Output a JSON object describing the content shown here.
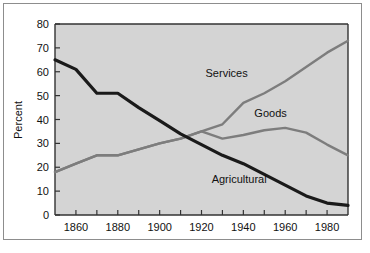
{
  "chart_data": {
    "type": "line",
    "title": "",
    "subtitle": "",
    "xlabel": "",
    "ylabel": "Percent",
    "xlim": [
      1850,
      1990
    ],
    "ylim": [
      0,
      80
    ],
    "grid": false,
    "legend_position": "inline-annotations",
    "x": [
      1850,
      1860,
      1870,
      1880,
      1890,
      1900,
      1910,
      1920,
      1930,
      1940,
      1950,
      1960,
      1970,
      1980,
      1990
    ],
    "xticks": [
      1860,
      1880,
      1900,
      1920,
      1940,
      1960,
      1980
    ],
    "xtick_labels": [
      "1860",
      "1880",
      "1900",
      "1920",
      "1940",
      "1960",
      "1980"
    ],
    "xminor_ticks": [
      1850,
      1860,
      1870,
      1880,
      1890,
      1900,
      1910,
      1920,
      1930,
      1940,
      1950,
      1960,
      1970,
      1980,
      1990
    ],
    "yticks": [
      0,
      10,
      20,
      30,
      40,
      50,
      60,
      70,
      80
    ],
    "ytick_labels": [
      "0",
      "10",
      "20",
      "30",
      "40",
      "50",
      "60",
      "70",
      "80"
    ],
    "series": [
      {
        "name": "Agricultural",
        "color": "#1a1a1a",
        "width": 3.2,
        "label_x": 1938,
        "label_y": 13.5,
        "values": [
          65,
          61,
          51,
          51,
          45,
          39.5,
          34,
          29.5,
          25,
          21.5,
          17,
          12.5,
          8,
          5,
          4
        ]
      },
      {
        "name": "Goods",
        "color": "#7d7d7d",
        "width": 2.4,
        "label_x": 1953,
        "label_y": 41,
        "values": [
          18,
          21.5,
          25,
          25,
          27.5,
          30,
          32,
          35,
          32,
          33.5,
          35.5,
          36.5,
          34.5,
          29.5,
          25
        ]
      },
      {
        "name": "Services",
        "color": "#7d7d7d",
        "width": 2.4,
        "label_x": 1932,
        "label_y": 58,
        "values": [
          18,
          21.5,
          25,
          25,
          27.5,
          30,
          32,
          35,
          38,
          47,
          51,
          56,
          62,
          68,
          73
        ]
      }
    ],
    "colors": {
      "plot_background": "#d4d4d4",
      "page_background": "#ffffff",
      "axis": "#333333",
      "frame": "#8d8d8d",
      "dark_line": "#1a1a1a",
      "gray_line": "#7d7d7d",
      "text": "#111111"
    }
  }
}
